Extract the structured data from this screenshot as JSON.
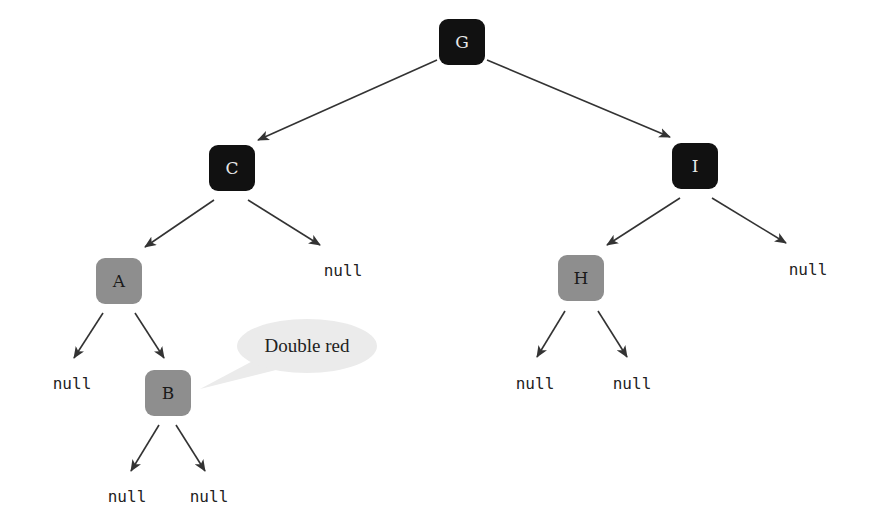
{
  "diagram": {
    "type": "red-black-tree",
    "colors": {
      "black_node": "#111111",
      "red_node": "#8e8e8e",
      "edge": "#333333",
      "bubble": "#ebebeb"
    },
    "nodes": [
      {
        "id": "G",
        "label": "G",
        "color": "black",
        "x": 462,
        "y": 42
      },
      {
        "id": "C",
        "label": "C",
        "color": "black",
        "x": 232,
        "y": 168
      },
      {
        "id": "I",
        "label": "I",
        "color": "black",
        "x": 695,
        "y": 166
      },
      {
        "id": "A",
        "label": "A",
        "color": "red",
        "x": 119,
        "y": 281
      },
      {
        "id": "H",
        "label": "H",
        "color": "red",
        "x": 581,
        "y": 278
      },
      {
        "id": "B",
        "label": "B",
        "color": "red",
        "x": 168,
        "y": 393
      }
    ],
    "nulls": [
      {
        "id": "null-C-right",
        "label": "null",
        "x": 343,
        "y": 272
      },
      {
        "id": "null-I-right",
        "label": "null",
        "x": 808,
        "y": 271
      },
      {
        "id": "null-A-left",
        "label": "null",
        "x": 72,
        "y": 385
      },
      {
        "id": "null-H-left",
        "label": "null",
        "x": 535,
        "y": 385
      },
      {
        "id": "null-H-right",
        "label": "null",
        "x": 632,
        "y": 385
      },
      {
        "id": "null-B-left",
        "label": "null",
        "x": 127,
        "y": 498
      },
      {
        "id": "null-B-right",
        "label": "null",
        "x": 209,
        "y": 498
      }
    ],
    "edges": [
      {
        "from": "G",
        "to": "C",
        "x1": 437,
        "y1": 60,
        "x2": 258,
        "y2": 140
      },
      {
        "from": "G",
        "to": "I",
        "x1": 487,
        "y1": 60,
        "x2": 670,
        "y2": 137
      },
      {
        "from": "C",
        "to": "A",
        "x1": 214,
        "y1": 200,
        "x2": 145,
        "y2": 247
      },
      {
        "from": "C",
        "to": "null",
        "x1": 248,
        "y1": 200,
        "x2": 320,
        "y2": 245
      },
      {
        "from": "I",
        "to": "H",
        "x1": 680,
        "y1": 198,
        "x2": 607,
        "y2": 245
      },
      {
        "from": "I",
        "to": "null",
        "x1": 712,
        "y1": 198,
        "x2": 786,
        "y2": 243
      },
      {
        "from": "A",
        "to": "null",
        "x1": 103,
        "y1": 313,
        "x2": 74,
        "y2": 358
      },
      {
        "from": "A",
        "to": "B",
        "x1": 135,
        "y1": 313,
        "x2": 164,
        "y2": 358
      },
      {
        "from": "H",
        "to": "null",
        "x1": 565,
        "y1": 311,
        "x2": 537,
        "y2": 357
      },
      {
        "from": "H",
        "to": "null",
        "x1": 598,
        "y1": 311,
        "x2": 627,
        "y2": 357
      },
      {
        "from": "B",
        "to": "null",
        "x1": 159,
        "y1": 425,
        "x2": 131,
        "y2": 471
      },
      {
        "from": "B",
        "to": "null",
        "x1": 176,
        "y1": 425,
        "x2": 205,
        "y2": 471
      }
    ],
    "callout": {
      "text": "Double red",
      "target": "B",
      "cx": 307,
      "cy": 346,
      "rx": 70,
      "ry": 27
    }
  }
}
